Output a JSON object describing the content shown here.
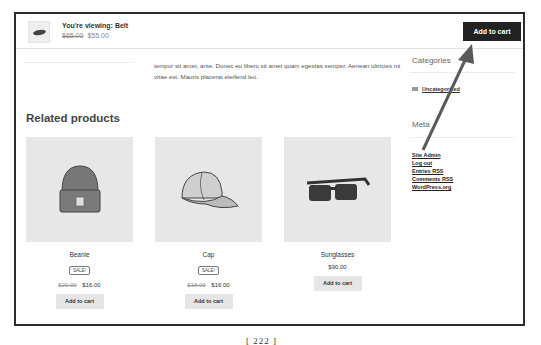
{
  "sticky_bar": {
    "viewing_label": "You're viewing: Belt",
    "old_price": "$65.00",
    "new_price": "$55.00",
    "add_to_cart_label": "Add to cart",
    "thumb_icon": "belt-thumbnail"
  },
  "description": {
    "text": "tempor sit amet, ante. Donec eu libero sit amet quam egestas semper. Aenean ultricies mi vitae est. Mauris placerat eleifend leo."
  },
  "related": {
    "title": "Related products",
    "products": [
      {
        "name": "Beanie",
        "badge": "SALE!",
        "old_price": "$20.00",
        "price": "$16.00",
        "button": "Add to cart",
        "image": "beanie-image"
      },
      {
        "name": "Cap",
        "badge": "SALE!",
        "old_price": "$18.00",
        "price": "$16.00",
        "button": "Add to cart",
        "image": "cap-image"
      },
      {
        "name": "Sunglasses",
        "badge": "",
        "old_price": "",
        "price": "$90.00",
        "button": "Add to cart",
        "image": "sunglasses-image"
      }
    ]
  },
  "sidebar": {
    "categories_title": "Categories",
    "categories": [
      {
        "label": "Uncategorized"
      }
    ],
    "meta_title": "Meta",
    "meta_links": [
      {
        "label": "Site Admin"
      },
      {
        "label": "Log out"
      },
      {
        "label": "Entries RSS"
      },
      {
        "label": "Comments RSS"
      },
      {
        "label": "WordPress.org"
      }
    ]
  },
  "annotation": {
    "arrow_color": "#555555"
  },
  "page_number": "[ 222 ]"
}
